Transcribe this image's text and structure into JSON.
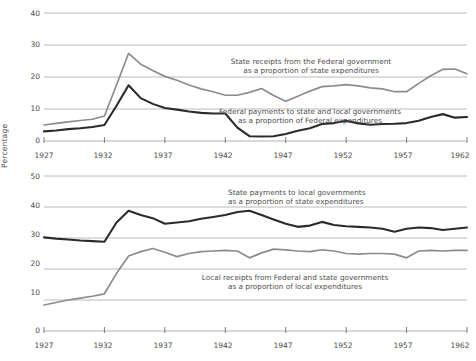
{
  "chart_data": [
    {
      "type": "line",
      "panel": "top",
      "title": "",
      "xlabel": "",
      "ylabel": "Percentage",
      "xlim": [
        1927,
        1962
      ],
      "ylim": [
        0,
        42
      ],
      "yticks": [
        0,
        10,
        20,
        30,
        40
      ],
      "xticks": [
        1927,
        1932,
        1937,
        1942,
        1947,
        1952,
        1957,
        1962
      ],
      "grid": "horizontal",
      "legend": "annotations-inline",
      "x": [
        1927,
        1928,
        1929,
        1930,
        1931,
        1932,
        1933,
        1934,
        1935,
        1936,
        1937,
        1938,
        1939,
        1940,
        1941,
        1942,
        1943,
        1944,
        1945,
        1946,
        1947,
        1948,
        1949,
        1950,
        1951,
        1952,
        1953,
        1954,
        1955,
        1956,
        1957,
        1958,
        1959,
        1960,
        1961,
        1962
      ],
      "series": [
        {
          "name": "State receipts from the Federal government as a proportion of state expenditures",
          "color": "#8c8c8c",
          "values": [
            5.0,
            5.5,
            6.0,
            6.4,
            6.8,
            7.8,
            17.5,
            27.4,
            24.0,
            22.0,
            20.2,
            19.0,
            17.5,
            16.3,
            15.4,
            14.3,
            14.3,
            15.2,
            16.4,
            14.2,
            12.4,
            14.0,
            15.6,
            17.0,
            17.2,
            17.6,
            17.2,
            16.6,
            16.3,
            15.4,
            15.4,
            18.0,
            20.4,
            22.4,
            22.5,
            21.0,
            22.2
          ]
        },
        {
          "name": "Federal payments to state and local governments as a proportion of Federal expenditures",
          "color": "#2b2b2b",
          "values": [
            3.0,
            3.3,
            3.7,
            4.0,
            4.4,
            5.0,
            11.0,
            17.4,
            13.4,
            11.6,
            10.3,
            9.8,
            9.2,
            8.8,
            8.6,
            8.6,
            4.2,
            1.5,
            1.4,
            1.5,
            2.2,
            3.2,
            4.0,
            5.3,
            5.6,
            6.3,
            5.5,
            5.1,
            5.3,
            5.4,
            5.6,
            6.3,
            7.5,
            8.4,
            7.3,
            7.5,
            7.6
          ]
        }
      ],
      "annotations": [
        {
          "line1": "State receipts from the Federal government",
          "line2": "as a proportion of state expenditures"
        },
        {
          "line1": "Federal payments to state and local governments",
          "line2": "as a proportion of Federal expenditures"
        }
      ]
    },
    {
      "type": "line",
      "panel": "bottom",
      "title": "",
      "xlabel": "",
      "ylabel": "Percentage",
      "xlim": [
        1927,
        1962
      ],
      "ylim": [
        0,
        52
      ],
      "yticks": [
        0,
        10,
        20,
        30,
        40,
        50
      ],
      "xticks": [
        1927,
        1932,
        1937,
        1942,
        1947,
        1952,
        1957,
        1962
      ],
      "grid": "horizontal",
      "legend": "annotations-inline",
      "x": [
        1927,
        1928,
        1929,
        1930,
        1931,
        1932,
        1933,
        1934,
        1935,
        1936,
        1937,
        1938,
        1939,
        1940,
        1941,
        1942,
        1943,
        1944,
        1945,
        1946,
        1947,
        1948,
        1949,
        1950,
        1951,
        1952,
        1953,
        1954,
        1955,
        1956,
        1957,
        1958,
        1959,
        1960,
        1961,
        1962
      ],
      "series": [
        {
          "name": "State payments to local governments as a proportion of state expenditures",
          "color": "#2b2b2b",
          "values": [
            30.2,
            29.8,
            29.5,
            29.2,
            29.0,
            28.8,
            35.0,
            38.8,
            37.4,
            36.4,
            34.6,
            35.0,
            35.4,
            36.2,
            36.8,
            37.4,
            38.4,
            38.8,
            37.4,
            36.0,
            34.6,
            33.6,
            34.0,
            35.2,
            34.2,
            33.8,
            33.6,
            33.4,
            33.0,
            32.0,
            33.0,
            33.4,
            33.2,
            32.6,
            33.0,
            33.4,
            33.4
          ]
        },
        {
          "name": "Local receipts from Federal and state governments as a proportion of local expenditures",
          "color": "#8c8c8c",
          "values": [
            8.4,
            9.2,
            10.0,
            10.6,
            11.2,
            12.0,
            18.6,
            24.2,
            25.6,
            26.6,
            25.4,
            24.0,
            25.0,
            25.6,
            25.8,
            26.0,
            25.8,
            23.6,
            25.2,
            26.4,
            26.2,
            25.8,
            25.6,
            26.2,
            25.8,
            25.0,
            24.8,
            25.0,
            25.0,
            24.8,
            23.6,
            25.8,
            26.0,
            25.8,
            26.0,
            26.0,
            26.0
          ]
        }
      ],
      "annotations": [
        {
          "line1": "State payments to local governments",
          "line2": "as a proportion of state expenditures"
        },
        {
          "line1": "Local receipts from Federal and state governments",
          "line2": "as a proportion of local expenditures"
        }
      ]
    }
  ],
  "panels": {
    "top": {
      "ylabel": "Percentage",
      "yticks": [
        "40",
        "30",
        "20",
        "10",
        "0"
      ],
      "xticks": [
        "1927",
        "1932",
        "1937",
        "1942",
        "1947",
        "1952",
        "1957",
        "1962"
      ],
      "annotation_a_line1": "State receipts from the Federal government",
      "annotation_a_line2": "as a proportion of state expenditures",
      "annotation_b_line1": "Federal payments to state and local governments",
      "annotation_b_line2": "as a proportion of Federal expenditures"
    },
    "bottom": {
      "ylabel": "Percentage",
      "yticks": [
        "50",
        "40",
        "30",
        "20",
        "10",
        "0"
      ],
      "xticks": [
        "1927",
        "1932",
        "1937",
        "1942",
        "1947",
        "1952",
        "1957",
        "1962"
      ],
      "annotation_a_line1": "State payments to local governments",
      "annotation_a_line2": "as a proportion of state expenditures",
      "annotation_b_line1": "Local receipts from Federal and state governments",
      "annotation_b_line2": "as a proportion of local expenditures"
    }
  },
  "colors": {
    "series_dark": "#2b2b2b",
    "series_gray": "#8c8c8c",
    "gridline": "#a8a8a8",
    "text": "#4a4a4a"
  }
}
